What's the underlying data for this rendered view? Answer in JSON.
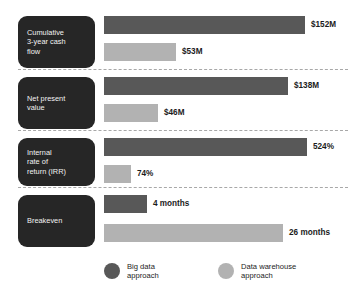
{
  "chart_data": {
    "type": "bar",
    "title": "",
    "orientation": "horizontal",
    "grid": false,
    "legend_position": "bottom",
    "categories": [
      "Cumulative\n3-year cash\nflow",
      "Net present\nvalue",
      "Internal\nrate of\nreturn (IRR)",
      "Breakeven"
    ],
    "series": [
      {
        "name": "Big data approach",
        "color": "#585858",
        "values": [
          152,
          138,
          524,
          4
        ],
        "labels": [
          "$152M",
          "$138M",
          "524%",
          "4 months"
        ]
      },
      {
        "name": "Data warehouse approach",
        "color": "#b2b2b2",
        "values": [
          53,
          46,
          74,
          26
        ],
        "labels": [
          "$53M",
          "$46M",
          "74%",
          "26 months"
        ]
      }
    ],
    "units": [
      "$M",
      "$M",
      "%",
      "months"
    ],
    "xlabel": "",
    "ylabel": ""
  },
  "rows": [
    {
      "category": "Cumulative\n3-year cash\nflow",
      "bars": [
        {
          "label": "$152M",
          "series": "Big data approach",
          "tone": "dark",
          "top": 16,
          "width": 201
        },
        {
          "label": "$53M",
          "series": "Data warehouse approach",
          "tone": "light",
          "top": 43,
          "width": 72
        }
      ],
      "divider_y": 69
    },
    {
      "category": "Net present\nvalue",
      "bars": [
        {
          "label": "$138M",
          "series": "Big data approach",
          "tone": "dark",
          "top": 77,
          "width": 184
        },
        {
          "label": "$46M",
          "series": "Data warehouse approach",
          "tone": "light",
          "top": 104,
          "width": 54
        }
      ],
      "divider_y": 130
    },
    {
      "category": "Internal\nrate of\nreturn (IRR)",
      "bars": [
        {
          "label": "524%",
          "series": "Big data approach",
          "tone": "dark",
          "top": 138,
          "width": 203
        },
        {
          "label": "74%",
          "series": "Data warehouse approach",
          "tone": "light",
          "top": 165,
          "width": 27
        }
      ],
      "divider_y": 187
    },
    {
      "category": "Breakeven",
      "bars": [
        {
          "label": "4 months",
          "series": "Big data approach",
          "tone": "dark",
          "top": 195,
          "width": 43
        },
        {
          "label": "26 months",
          "series": "Data warehouse approach",
          "tone": "light",
          "top": 224,
          "width": 179
        }
      ],
      "divider_y": null
    }
  ],
  "category_boxes": [
    {
      "label": "Cumulative\n3-year cash\nflow",
      "top": 16,
      "height": 52
    },
    {
      "label": "Net present\nvalue",
      "top": 77,
      "height": 52
    },
    {
      "label": "Internal\nrate of\nreturn (IRR)",
      "top": 138,
      "height": 48
    },
    {
      "label": "Breakeven",
      "top": 195,
      "height": 52
    }
  ],
  "legend": {
    "items": [
      {
        "label": "Big data\napproach",
        "tone": "dark",
        "left": 104
      },
      {
        "label": "Data warehouse\napproach",
        "tone": "light",
        "left": 218
      }
    ]
  },
  "geometry": {
    "bar_left": 104,
    "bar_height": 18,
    "value_gap": 6
  },
  "colors": {
    "big_data": "#585858",
    "data_warehouse": "#b2b2b2",
    "category_box": "#262626",
    "category_text": "#f2f2f2",
    "value_text": "#1c1c1c",
    "divider": "#a8a8a8",
    "background": "#ffffff"
  }
}
